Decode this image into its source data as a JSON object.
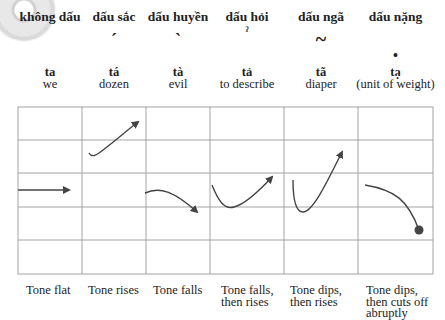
{
  "tones": [
    {
      "name": "không dấu",
      "mark": "",
      "word": "ta",
      "meaning": "we",
      "description": "Tone flat",
      "contour": "flat"
    },
    {
      "name": "dấu sắc",
      "mark": "ˊ",
      "word": "tá",
      "meaning": "dozen",
      "description": "Tone rises",
      "contour": "rise"
    },
    {
      "name": "dấu huyền",
      "mark": "ˋ",
      "word": "tà",
      "meaning": "evil",
      "description": "Tone falls",
      "contour": "fall"
    },
    {
      "name": "dấu hỏi",
      "mark": "ˀ",
      "word": "tả",
      "meaning": "to describe",
      "description": "Tone falls,\nthen rises",
      "contour": "fall-rise"
    },
    {
      "name": "dấu ngã",
      "mark": "~",
      "word": "tã",
      "meaning": "diaper",
      "description": "Tone dips,\nthen rises",
      "contour": "dip-rise"
    },
    {
      "name": "dấu nặng",
      "mark": "•",
      "word": "tạ",
      "meaning": "(unit of weight)",
      "description": "Tone dips,\nthen cuts off\nabruptly",
      "contour": "dip-cut"
    }
  ],
  "grid": {
    "columns": 6,
    "rows": 5,
    "line_color": "#9a9a9a",
    "curve_color": "#444444"
  }
}
